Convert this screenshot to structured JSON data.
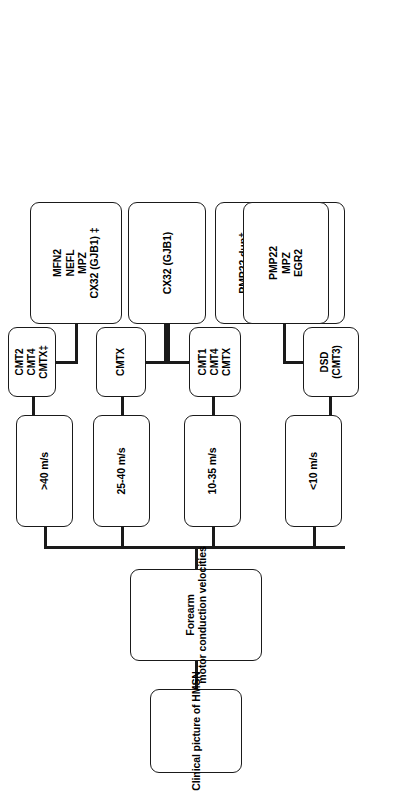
{
  "figure": {
    "orientation": "rotated-90-ccw",
    "title_node": "Clinical picture of HMSN",
    "test_node_line1": "Forearm",
    "test_node_line2": "motor conduction velocities"
  },
  "branches": [
    {
      "id": "lt10",
      "velocity": "<10 m/s",
      "diagnosis": {
        "line1": "DSD",
        "line2": "(CMT3)"
      },
      "genes": [
        "PMP22",
        "MPZ",
        "EGR2"
      ]
    },
    {
      "id": "b10_35",
      "velocity": "10-35 m/s",
      "diagnosis": {
        "line1": "CMT1",
        "line2": "CMT4",
        "line3": "CMTX"
      },
      "genes": [
        "PMP22 dup†",
        "PMP22 del†*",
        "MPZ",
        "PRX",
        "NEFL",
        "LITAF",
        "CX32(GJB1)"
      ]
    },
    {
      "id": "b25_40",
      "velocity": "25-40 m/s",
      "diagnosis": {
        "line1": "CMTX"
      },
      "genes": [
        "CX32 (GJB1)"
      ]
    },
    {
      "id": "gt40",
      "velocity": ">40 m/s",
      "diagnosis": {
        "line1": "CMT2",
        "line2": "CMT4",
        "line3": "CMTX‡"
      },
      "genes": [
        "MFN2",
        "NEFL",
        "MPZ",
        "CX32 (GJB1) ‡"
      ]
    }
  ],
  "colors": {
    "line": "#1a1a1a",
    "box_fill": "#ffffff",
    "text": "#000000"
  }
}
